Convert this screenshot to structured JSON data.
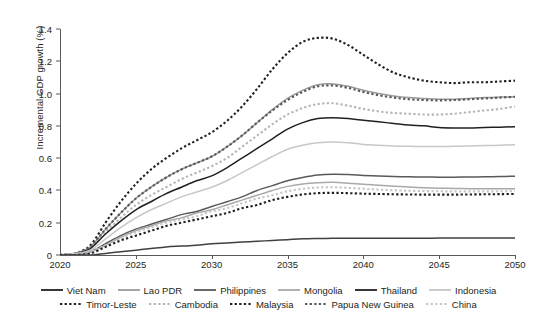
{
  "chart_data": {
    "type": "line",
    "title": "",
    "xlabel": "",
    "ylabel": "Incremental GDP growth (%)",
    "xlim": [
      2020,
      2050
    ],
    "ylim": [
      0,
      1.4
    ],
    "ytick_labels": [
      "0",
      "0.2",
      "0.4",
      "0.6",
      "0.8",
      "1.0",
      "1.2",
      "1.4"
    ],
    "ytick_values": [
      0,
      0.2,
      0.4,
      0.6,
      0.8,
      1.0,
      1.2,
      1.4
    ],
    "xtick_labels": [
      "2020",
      "2025",
      "2030",
      "2035",
      "2040",
      "2045",
      "2050"
    ],
    "xtick_values": [
      2020,
      2025,
      2030,
      2035,
      2040,
      2045,
      2050
    ],
    "grid": false,
    "legend_position": "bottom",
    "x": [
      2020,
      2021,
      2022,
      2023,
      2024,
      2025,
      2026,
      2027,
      2028,
      2029,
      2030,
      2031,
      2032,
      2033,
      2034,
      2035,
      2036,
      2037,
      2038,
      2039,
      2040,
      2041,
      2042,
      2043,
      2044,
      2045,
      2046,
      2047,
      2048,
      2049,
      2050
    ],
    "series": [
      {
        "name": "Timor-Leste",
        "style": "dotted",
        "color": "#231f20",
        "values": [
          0.0,
          0.01,
          0.06,
          0.2,
          0.33,
          0.44,
          0.53,
          0.6,
          0.66,
          0.71,
          0.76,
          0.83,
          0.92,
          1.03,
          1.15,
          1.25,
          1.32,
          1.345,
          1.34,
          1.3,
          1.24,
          1.18,
          1.13,
          1.1,
          1.08,
          1.07,
          1.065,
          1.07,
          1.07,
          1.075,
          1.08
        ]
      },
      {
        "name": "Lao PDR",
        "style": "solid",
        "color": "#9a9b9e",
        "values": [
          0.0,
          0.01,
          0.05,
          0.16,
          0.26,
          0.35,
          0.42,
          0.48,
          0.53,
          0.57,
          0.61,
          0.67,
          0.74,
          0.82,
          0.9,
          0.97,
          1.02,
          1.055,
          1.06,
          1.045,
          1.02,
          1.0,
          0.985,
          0.975,
          0.97,
          0.965,
          0.965,
          0.97,
          0.975,
          0.978,
          0.98
        ]
      },
      {
        "name": "Mongolia",
        "style": "dotted",
        "color": "#58595b",
        "values": [
          0.0,
          0.01,
          0.05,
          0.16,
          0.26,
          0.35,
          0.42,
          0.48,
          0.53,
          0.57,
          0.61,
          0.67,
          0.74,
          0.82,
          0.895,
          0.96,
          1.01,
          1.045,
          1.05,
          1.035,
          1.01,
          0.99,
          0.975,
          0.965,
          0.96,
          0.958,
          0.96,
          0.965,
          0.97,
          0.975,
          0.98
        ]
      },
      {
        "name": "Cambodia",
        "style": "dotted",
        "color": "#b5b6b8",
        "values": [
          0.0,
          0.01,
          0.04,
          0.14,
          0.23,
          0.31,
          0.37,
          0.42,
          0.47,
          0.51,
          0.55,
          0.6,
          0.67,
          0.74,
          0.81,
          0.87,
          0.91,
          0.935,
          0.94,
          0.925,
          0.905,
          0.89,
          0.88,
          0.875,
          0.87,
          0.87,
          0.875,
          0.885,
          0.895,
          0.905,
          0.92
        ]
      },
      {
        "name": "Viet Nam",
        "style": "solid",
        "color": "#231f20",
        "values": [
          0.0,
          0.01,
          0.04,
          0.13,
          0.21,
          0.28,
          0.33,
          0.38,
          0.42,
          0.46,
          0.49,
          0.54,
          0.6,
          0.66,
          0.72,
          0.78,
          0.82,
          0.845,
          0.85,
          0.845,
          0.835,
          0.825,
          0.815,
          0.805,
          0.8,
          0.79,
          0.787,
          0.787,
          0.79,
          0.792,
          0.795
        ]
      },
      {
        "name": "Philippines",
        "style": "solid",
        "color": "#c6c7c9",
        "values": [
          0.0,
          0.01,
          0.03,
          0.1,
          0.17,
          0.23,
          0.28,
          0.32,
          0.36,
          0.39,
          0.42,
          0.46,
          0.51,
          0.56,
          0.61,
          0.655,
          0.68,
          0.695,
          0.7,
          0.695,
          0.685,
          0.68,
          0.675,
          0.673,
          0.672,
          0.672,
          0.673,
          0.675,
          0.678,
          0.68,
          0.683
        ]
      },
      {
        "name": "Thailand",
        "style": "solid",
        "color": "#58595b",
        "values": [
          0.0,
          0.0,
          0.02,
          0.07,
          0.12,
          0.16,
          0.19,
          0.22,
          0.25,
          0.27,
          0.3,
          0.33,
          0.36,
          0.4,
          0.43,
          0.46,
          0.48,
          0.495,
          0.5,
          0.498,
          0.493,
          0.489,
          0.486,
          0.484,
          0.483,
          0.482,
          0.482,
          0.483,
          0.484,
          0.486,
          0.488
        ]
      },
      {
        "name": "Indonesia",
        "style": "solid",
        "color": "#a7a9ac",
        "values": [
          0.0,
          0.0,
          0.02,
          0.06,
          0.11,
          0.15,
          0.18,
          0.21,
          0.23,
          0.26,
          0.28,
          0.31,
          0.34,
          0.37,
          0.4,
          0.425,
          0.44,
          0.448,
          0.45,
          0.445,
          0.438,
          0.432,
          0.426,
          0.421,
          0.417,
          0.414,
          0.412,
          0.411,
          0.41,
          0.41,
          0.41
        ]
      },
      {
        "name": "China",
        "style": "dotted",
        "color": "#c6c7c9",
        "values": [
          0.0,
          0.0,
          0.02,
          0.06,
          0.1,
          0.14,
          0.17,
          0.2,
          0.22,
          0.24,
          0.27,
          0.29,
          0.32,
          0.35,
          0.37,
          0.395,
          0.41,
          0.418,
          0.42,
          0.416,
          0.41,
          0.405,
          0.401,
          0.398,
          0.396,
          0.395,
          0.394,
          0.394,
          0.394,
          0.395,
          0.396
        ]
      },
      {
        "name": "Malaysia",
        "style": "dotted",
        "color": "#231f20",
        "values": [
          0.0,
          0.0,
          0.01,
          0.05,
          0.09,
          0.12,
          0.15,
          0.18,
          0.2,
          0.22,
          0.24,
          0.26,
          0.29,
          0.31,
          0.34,
          0.36,
          0.375,
          0.383,
          0.385,
          0.383,
          0.38,
          0.378,
          0.376,
          0.375,
          0.374,
          0.374,
          0.374,
          0.375,
          0.376,
          0.377,
          0.378
        ]
      },
      {
        "name": "Papua New Guinea",
        "style": "solid",
        "color": "#404041",
        "values": [
          0.0,
          0.0,
          0.0,
          0.01,
          0.02,
          0.03,
          0.04,
          0.05,
          0.055,
          0.06,
          0.07,
          0.075,
          0.08,
          0.085,
          0.09,
          0.095,
          0.1,
          0.102,
          0.103,
          0.104,
          0.104,
          0.104,
          0.104,
          0.104,
          0.104,
          0.105,
          0.105,
          0.105,
          0.105,
          0.105,
          0.105
        ]
      }
    ],
    "legend_rows": [
      [
        {
          "label": "Viet Nam",
          "style": "solid",
          "color": "#231f20"
        },
        {
          "label": "Lao PDR",
          "style": "solid",
          "color": "#9a9b9e"
        },
        {
          "label": "Philippines",
          "style": "solid",
          "color": "#58595b"
        },
        {
          "label": "Mongolia",
          "style": "solid",
          "color": "#a7a9ac"
        },
        {
          "label": "Thailand",
          "style": "solid",
          "color": "#231f20"
        },
        {
          "label": "Indonesia",
          "style": "solid",
          "color": "#c6c7c9"
        }
      ],
      [
        {
          "label": "Timor-Leste",
          "style": "dotted",
          "color": "#231f20"
        },
        {
          "label": "Cambodia",
          "style": "dotted",
          "color": "#b5b6b8"
        },
        {
          "label": "Malaysia",
          "style": "dotted",
          "color": "#231f20"
        },
        {
          "label": "Papua New Guinea",
          "style": "dotted",
          "color": "#58595b"
        },
        {
          "label": "China",
          "style": "dotted",
          "color": "#c6c7c9"
        }
      ]
    ]
  }
}
